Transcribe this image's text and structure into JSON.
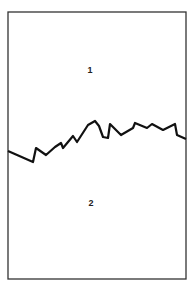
{
  "diagram": {
    "type": "cross-section",
    "frame": {
      "x": 8,
      "y": 12,
      "width": 178,
      "height": 267,
      "stroke": "#333333"
    },
    "regions": [
      {
        "label": "1",
        "x": 90,
        "y": 73
      },
      {
        "label": "2",
        "x": 91,
        "y": 206
      }
    ],
    "boundary_line": {
      "stroke": "#111111",
      "stroke_width": 2.2,
      "points": [
        [
          8,
          151
        ],
        [
          33,
          162
        ],
        [
          36,
          148
        ],
        [
          46,
          155
        ],
        [
          55,
          147
        ],
        [
          61,
          143
        ],
        [
          63,
          148
        ],
        [
          73,
          136
        ],
        [
          77,
          142
        ],
        [
          88,
          125
        ],
        [
          95,
          121
        ],
        [
          99,
          126
        ],
        [
          103,
          137
        ],
        [
          108,
          138
        ],
        [
          110,
          124
        ],
        [
          121,
          135
        ],
        [
          133,
          128
        ],
        [
          135,
          123
        ],
        [
          147,
          128
        ],
        [
          152,
          124
        ],
        [
          163,
          130
        ],
        [
          175,
          124
        ],
        [
          177,
          135
        ],
        [
          186,
          139
        ]
      ]
    }
  }
}
